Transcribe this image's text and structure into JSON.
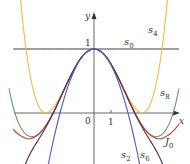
{
  "figure": {
    "axis_labels": {
      "x": "x",
      "y": "y"
    },
    "tick_labels": {
      "origin": "0",
      "x_one": "1",
      "y_one": "1"
    },
    "curve_labels": {
      "s0": {
        "base": "s",
        "sub": "0"
      },
      "s2": {
        "base": "s",
        "sub": "2"
      },
      "s4": {
        "base": "s",
        "sub": "4"
      },
      "s6": {
        "base": "s",
        "sub": "6"
      },
      "s8": {
        "base": "s",
        "sub": "8"
      },
      "J0": {
        "base": "J",
        "sub": "0"
      }
    }
  },
  "chart_data": {
    "type": "line",
    "title": "",
    "xlabel": "x",
    "ylabel": "y",
    "xlim": [
      -5.5,
      5.0
    ],
    "ylim": [
      -0.8,
      1.7
    ],
    "grid": false,
    "legend": "inline labels",
    "note": "Bessel function J0 and its Taylor polynomial approximations s0, s2, s4, s6, s8 (even functions; values given for x >= 0, mirrored for x < 0)",
    "x": [
      0,
      0.25,
      0.5,
      0.75,
      1,
      1.25,
      1.5,
      1.75,
      2,
      2.25,
      2.5,
      2.75,
      3,
      3.25,
      3.5,
      3.75,
      4,
      4.25,
      4.5,
      4.75,
      5
    ],
    "series": [
      {
        "name": "s0",
        "color": "#3a3a3a",
        "values": [
          1,
          1,
          1,
          1,
          1,
          1,
          1,
          1,
          1,
          1,
          1,
          1,
          1,
          1,
          1,
          1,
          1,
          1,
          1,
          1,
          1
        ]
      },
      {
        "name": "s2",
        "color": "#4a5fc1",
        "values": [
          1,
          0.98438,
          0.9375,
          0.85938,
          0.75,
          0.60938,
          0.4375,
          0.23438,
          0,
          -0.26563,
          -0.5625,
          -0.89063,
          -1.25,
          -1.64063,
          -2.0625,
          -2.51563,
          -3,
          -3.51563,
          -4.0625,
          -4.64,
          -5.25
        ]
      },
      {
        "name": "s4",
        "color": "#f2b84b",
        "values": [
          1,
          0.98444,
          0.93848,
          0.86432,
          0.765625,
          0.64752,
          0.5166,
          0.38092,
          0.25,
          0.13483,
          0.04785,
          0.00298,
          0.015625,
          0.10259,
          0.28223,
          0.57427,
          1,
          1.5821,
          2.3447,
          3.314,
          4.5156
        ]
      },
      {
        "name": "s6",
        "color": "#5b2a4a",
        "values": [
          1,
          0.98444,
          0.93847,
          0.86424,
          0.765191,
          0.64587,
          0.51166,
          0.36845,
          0.22222,
          0.07851,
          -0.05811,
          -0.18474,
          -0.30078,
          -0.40888,
          -0.51563,
          -0.63273,
          -0.77778,
          -0.9756,
          -1.2594,
          -1.671,
          -2.2661
        ]
      },
      {
        "name": "s8",
        "color": "#5f9e5a",
        "values": [
          1,
          0.98444,
          0.93847,
          0.86424,
          0.765198,
          0.64591,
          0.51183,
          0.36905,
          0.22396,
          0.08297,
          -0.04776,
          -0.16256,
          -0.25629,
          -0.32447,
          -0.36291,
          -0.36753,
          -0.33333,
          -0.25374,
          -0.1191,
          0.0865,
          0.383
        ]
      },
      {
        "name": "J0",
        "color": "#d23a3a",
        "values": [
          1,
          0.98444,
          0.93847,
          0.86424,
          0.7652,
          0.64591,
          0.51183,
          0.36903,
          0.22389,
          0.08274,
          -0.04838,
          -0.16414,
          -0.26005,
          -0.33507,
          -0.38013,
          -0.4014,
          -0.39715,
          -0.36498,
          -0.32054,
          -0.25724,
          -0.1776
        ]
      }
    ],
    "annotations": [
      "s0",
      "s2",
      "s4",
      "s6",
      "s8",
      "J0",
      "0",
      "1",
      "1"
    ]
  }
}
